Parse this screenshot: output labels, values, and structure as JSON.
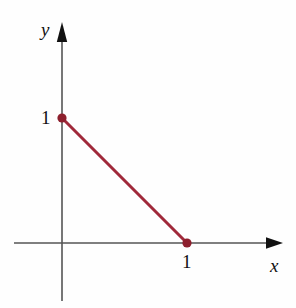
{
  "figure": {
    "title": "",
    "background_color": "#fefefe",
    "width": 296,
    "height": 308
  },
  "axes": {
    "x": {
      "name": "x",
      "icon": "arrow-right-icon",
      "color": "#555555",
      "arrow_color": "#111111",
      "origin_px": [
        62,
        243
      ],
      "start_px": [
        14,
        243
      ],
      "end_px": [
        283,
        243
      ],
      "ticks": [
        {
          "label": "1",
          "value": 1,
          "px": [
            187,
            243
          ]
        }
      ]
    },
    "y": {
      "name": "y",
      "icon": "arrow-up-icon",
      "color": "#555555",
      "arrow_color": "#111111",
      "origin_px": [
        62,
        243
      ],
      "start_px": [
        62,
        301
      ],
      "end_px": [
        62,
        22
      ],
      "ticks": [
        {
          "label": "1",
          "value": 1,
          "px": [
            62,
            118
          ]
        }
      ]
    }
  },
  "chart_data": {
    "type": "line",
    "title": "",
    "xlabel": "x",
    "ylabel": "y",
    "xlim": [
      -0.4,
      1.85
    ],
    "ylim": [
      -0.5,
      1.8
    ],
    "grid": false,
    "legend": null,
    "series": [
      {
        "name": "segment",
        "color": "#a0293a",
        "linewidth": 3,
        "marker": "filled-circle",
        "marker_color": "#8d1f2d",
        "marker_size": 5,
        "x": [
          0,
          1
        ],
        "y": [
          1,
          0
        ],
        "points_px": [
          [
            62,
            118
          ],
          [
            187,
            243
          ]
        ],
        "equation": "x + y = 1"
      }
    ],
    "xticks": [
      1
    ],
    "xticklabels": [
      "1"
    ],
    "yticks": [
      1
    ],
    "yticklabels": [
      "1"
    ]
  }
}
